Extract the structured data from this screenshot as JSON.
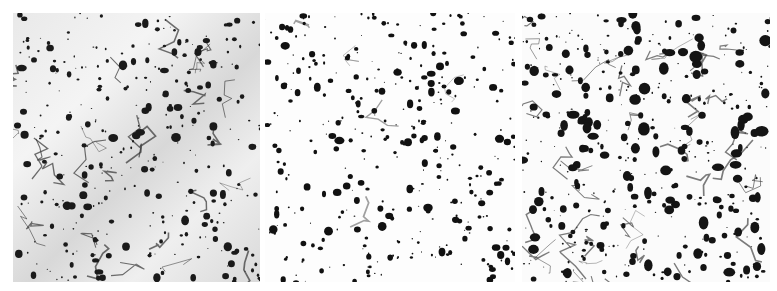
{
  "figure": {
    "panels": [
      {
        "id": "p1",
        "description": "micrograph-relief-shaded",
        "seed": 11,
        "count": 330,
        "maxr": 3.6,
        "color": "#1a1a1a",
        "cracks": 28,
        "crackColor": "#333333"
      },
      {
        "id": "p2",
        "description": "micrograph-sparse-particles",
        "seed": 23,
        "count": 360,
        "maxr": 3.4,
        "color": "#111111",
        "cracks": 6,
        "crackColor": "#777777"
      },
      {
        "id": "p3",
        "description": "micrograph-dense-particles",
        "seed": 37,
        "count": 420,
        "maxr": 4.8,
        "color": "#141414",
        "cracks": 40,
        "crackColor": "#444444"
      }
    ]
  }
}
